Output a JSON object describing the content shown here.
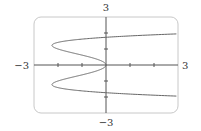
{
  "chart_data": {
    "type": "line",
    "title": "",
    "xlabel": "",
    "ylabel": "",
    "equation": "x = y^4 - 3y^2",
    "xlim": [
      -3,
      3
    ],
    "ylim": [
      -3,
      3
    ],
    "grid": false,
    "legend": null,
    "axis_labels": {
      "x_min": "−3",
      "x_max": "3",
      "y_max": "3",
      "y_min": "−3"
    },
    "x_ticks": [
      -2,
      -1,
      1,
      2
    ],
    "y_ticks": [
      -2,
      -1,
      1,
      2
    ],
    "series": [
      {
        "name": "curve",
        "points": [
          {
            "x": 3.0,
            "y": -1.94
          },
          {
            "x": 0.0,
            "y": -1.73
          },
          {
            "x": -2.25,
            "y": -1.22
          },
          {
            "x": -1.25,
            "y": -0.71
          },
          {
            "x": 0.0,
            "y": 0.0
          },
          {
            "x": -1.25,
            "y": 0.71
          },
          {
            "x": -2.25,
            "y": 1.22
          },
          {
            "x": 0.0,
            "y": 1.73
          },
          {
            "x": 3.0,
            "y": 1.94
          }
        ]
      }
    ],
    "colors": {
      "frame": "#c8c8c8",
      "axes": "#555555",
      "curve": "#666666"
    }
  }
}
